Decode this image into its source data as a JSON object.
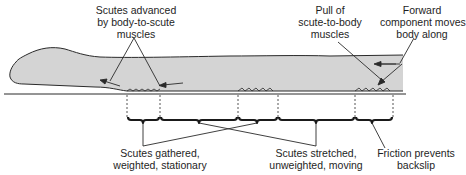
{
  "diagram": {
    "colors": {
      "body_fill": "#d4d4d4",
      "outline": "#2a2a2a",
      "text": "#1e1e1e",
      "background": "#ffffff"
    },
    "labels": {
      "scutes_advanced": [
        "Scutes advanced",
        "by body-to-scute",
        "muscles"
      ],
      "pull": [
        "Pull of",
        "scute-to-body",
        "muscles"
      ],
      "forward": [
        "Forward",
        "component moves",
        "body along"
      ],
      "gathered": [
        "Scutes gathered,",
        "weighted, stationary"
      ],
      "stretched": [
        "Scutes stretched,",
        "unweighted, moving"
      ],
      "friction": [
        "Friction prevents",
        "backslip"
      ]
    },
    "segments": [
      {
        "from": 127,
        "to": 160,
        "type": "gathered"
      },
      {
        "from": 160,
        "to": 238,
        "type": "stretched"
      },
      {
        "from": 238,
        "to": 278,
        "type": "gathered"
      },
      {
        "from": 278,
        "to": 355,
        "type": "stretched"
      },
      {
        "from": 355,
        "to": 393,
        "type": "friction"
      }
    ]
  }
}
